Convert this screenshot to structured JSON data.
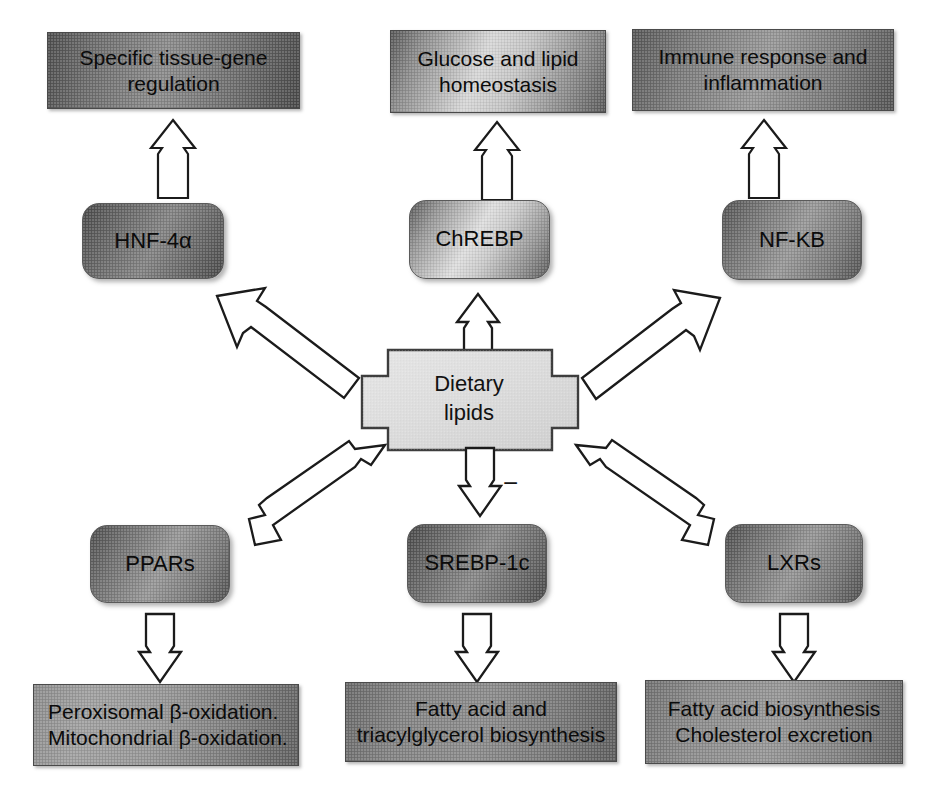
{
  "figure": {
    "background": "#ffffff",
    "outline_color": "#4a4a4a",
    "text_color": "#0b0b0b"
  },
  "central_node": {
    "name": "dietary-lipids",
    "label": "Dietary\nlipids",
    "shape": "cross",
    "fill": "#e2e2e2"
  },
  "annotations": {
    "inhibition_sign": "−"
  },
  "factors": [
    {
      "id": "hnf4a",
      "label": "HNF-4α"
    },
    {
      "id": "chrebp",
      "label": "ChREBP"
    },
    {
      "id": "nfkb",
      "label": "NF-KB"
    },
    {
      "id": "ppars",
      "label": "PPARs"
    },
    {
      "id": "srebp1c",
      "label": "SREBP-1c"
    },
    {
      "id": "lxrs",
      "label": "LXRs"
    }
  ],
  "outcomes": [
    {
      "id": "tissue-gene-regulation",
      "label": "Specific tissue-gene\nregulation"
    },
    {
      "id": "glucose-lipid-homeostasis",
      "label": "Glucose and lipid\nhomeostasis"
    },
    {
      "id": "immune-response-inflammation",
      "label": "Immune response and\ninflammation"
    },
    {
      "id": "beta-oxidation",
      "label": "Peroxisomal β-oxidation.\nMitochondrial β-oxidation."
    },
    {
      "id": "fa-tag-biosynthesis",
      "label": "Fatty acid and\ntriacylglycerol biosynthesis"
    },
    {
      "id": "fa-biosynthesis-cholesterol-excretion",
      "label": "Fatty acid biosynthesis\nCholesterol excretion"
    }
  ],
  "edges": [
    {
      "id": "lipids-to-hnf4a",
      "from": "dietary-lipids",
      "to": "hnf4a",
      "direction": "up-left",
      "style": "open-block-arrow"
    },
    {
      "id": "lipids-to-chrebp",
      "from": "dietary-lipids",
      "to": "chrebp",
      "direction": "up",
      "style": "open-block-arrow"
    },
    {
      "id": "lipids-to-nfkb",
      "from": "dietary-lipids",
      "to": "nfkb",
      "direction": "up-right",
      "style": "open-block-arrow"
    },
    {
      "id": "lipids-to-ppars",
      "from": "dietary-lipids",
      "to": "ppars",
      "direction": "down-left",
      "style": "open-block-arrow"
    },
    {
      "id": "lipids-to-srebp1c",
      "from": "dietary-lipids",
      "to": "srebp1c",
      "direction": "down",
      "style": "open-block-arrow",
      "sign": "−"
    },
    {
      "id": "lipids-to-lxrs",
      "from": "dietary-lipids",
      "to": "lxrs",
      "direction": "down-right",
      "style": "open-block-arrow"
    },
    {
      "id": "hnf4a-to-outcome",
      "from": "hnf4a",
      "to": "tissue-gene-regulation",
      "direction": "up",
      "style": "open-block-arrow"
    },
    {
      "id": "chrebp-to-outcome",
      "from": "chrebp",
      "to": "glucose-lipid-homeostasis",
      "direction": "up",
      "style": "open-block-arrow"
    },
    {
      "id": "nfkb-to-outcome",
      "from": "nfkb",
      "to": "immune-response-inflammation",
      "direction": "up",
      "style": "open-block-arrow"
    },
    {
      "id": "ppars-to-outcome",
      "from": "ppars",
      "to": "beta-oxidation",
      "direction": "down",
      "style": "open-block-arrow"
    },
    {
      "id": "srebp1c-to-outcome",
      "from": "srebp1c",
      "to": "fa-tag-biosynthesis",
      "direction": "down",
      "style": "open-block-arrow"
    },
    {
      "id": "lxrs-to-outcome",
      "from": "lxrs",
      "to": "fa-biosynthesis-cholesterol-excretion",
      "direction": "down",
      "style": "open-block-arrow"
    }
  ]
}
